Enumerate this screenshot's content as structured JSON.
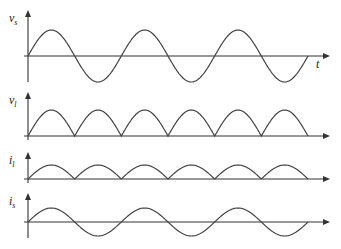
{
  "diagram": {
    "title": "",
    "time_axis_label": "t",
    "panels": [
      {
        "id": "vs",
        "label": "v",
        "subscript": "s",
        "waveform": "sine",
        "cycles": 3,
        "baseline_y": 56,
        "amplitude": 26,
        "axis_top": 10,
        "axis_bottom": 82,
        "show_t_label": true
      },
      {
        "id": "vl",
        "label": "v",
        "subscript": "l",
        "waveform": "full-wave-rectified",
        "cycles": 3,
        "baseline_y": 136,
        "amplitude": 26,
        "axis_top": 92,
        "axis_bottom": 140,
        "show_t_label": false
      },
      {
        "id": "il",
        "label": "i",
        "subscript": "l",
        "waveform": "full-wave-rectified",
        "cycles": 3,
        "baseline_y": 179,
        "amplitude": 14,
        "axis_top": 152,
        "axis_bottom": 183,
        "show_t_label": false
      },
      {
        "id": "is",
        "label": "i",
        "subscript": "s",
        "waveform": "sine",
        "cycles": 3,
        "baseline_y": 222,
        "amplitude": 14,
        "axis_top": 193,
        "axis_bottom": 238,
        "show_t_label": false
      }
    ],
    "x_start": 28,
    "x_wave_end": 308,
    "x_axis_end": 330,
    "colors": {
      "axis": "#333333",
      "wave": "#444444",
      "background": "#ffffff"
    }
  }
}
